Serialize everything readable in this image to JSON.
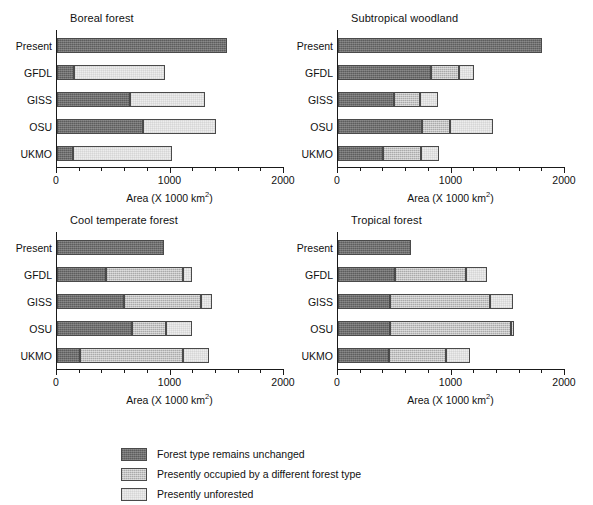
{
  "figure": {
    "categories": [
      "Present",
      "GFDL",
      "GISS",
      "OSU",
      "UKMO"
    ],
    "xlabel_pre": "Area (X 1000 km",
    "xlabel_sup": "2",
    "xlabel_post": ")",
    "xticklabels": [
      "0",
      "1000",
      "2000"
    ],
    "xlim": [
      0,
      2000
    ],
    "xtick_major": [
      0,
      1000,
      2000
    ],
    "xtick_minor_step": 200,
    "colors": {
      "unchanged": "#6f6f6f",
      "different_forest_type": "#c3c3c3",
      "unforested": "#ededed",
      "outline": "#4a4a4a",
      "axis": "#1a1a1a",
      "text": "#111111",
      "background": "#ffffff"
    }
  },
  "legend": {
    "items": [
      {
        "label": "Forest type remains unchanged",
        "swatch": "s0"
      },
      {
        "label": "Presently occupied by a different forest type",
        "swatch": "s1"
      },
      {
        "label": "Presently unforested",
        "swatch": "s2"
      }
    ]
  },
  "chart_data": [
    {
      "type": "bar",
      "orientation": "horizontal",
      "stacked": true,
      "title": "Boreal forest",
      "xlabel": "Area (X 1000 km2)",
      "ylabel": "",
      "xlim": [
        0,
        2000
      ],
      "grid": false,
      "legend_position": "below-figure",
      "categories": [
        "Present",
        "GFDL",
        "GISS",
        "OSU",
        "UKMO"
      ],
      "series": [
        {
          "name": "Forest type remains unchanged",
          "values": [
            1500,
            150,
            640,
            760,
            140
          ]
        },
        {
          "name": "Presently occupied by a different forest type",
          "values": [
            0,
            0,
            0,
            0,
            0
          ]
        },
        {
          "name": "Presently unforested",
          "values": [
            0,
            800,
            660,
            640,
            870
          ]
        }
      ],
      "totals": [
        1500,
        950,
        1300,
        1400,
        1010
      ]
    },
    {
      "type": "bar",
      "orientation": "horizontal",
      "stacked": true,
      "title": "Subtropical woodland",
      "xlabel": "Area (X 1000 km2)",
      "ylabel": "",
      "xlim": [
        0,
        2000
      ],
      "grid": false,
      "legend_position": "below-figure",
      "categories": [
        "Present",
        "GFDL",
        "GISS",
        "OSU",
        "UKMO"
      ],
      "series": [
        {
          "name": "Forest type remains unchanged",
          "values": [
            1800,
            820,
            490,
            740,
            400
          ]
        },
        {
          "name": "Presently occupied by a different forest type",
          "values": [
            0,
            250,
            230,
            250,
            330
          ]
        },
        {
          "name": "Presently unforested",
          "values": [
            0,
            130,
            160,
            380,
            160
          ]
        }
      ],
      "totals": [
        1800,
        1200,
        880,
        1370,
        890
      ]
    },
    {
      "type": "bar",
      "orientation": "horizontal",
      "stacked": true,
      "title": "Cool temperate forest",
      "xlabel": "Area (X 1000 km2)",
      "ylabel": "",
      "xlim": [
        0,
        2000
      ],
      "grid": false,
      "legend_position": "below-figure",
      "categories": [
        "Present",
        "GFDL",
        "GISS",
        "OSU",
        "UKMO"
      ],
      "series": [
        {
          "name": "Forest type remains unchanged",
          "values": [
            940,
            430,
            590,
            660,
            200
          ]
        },
        {
          "name": "Presently occupied by a different forest type",
          "values": [
            0,
            680,
            680,
            300,
            910
          ]
        },
        {
          "name": "Presently unforested",
          "values": [
            0,
            80,
            100,
            230,
            230
          ]
        }
      ],
      "totals": [
        940,
        1190,
        1370,
        1190,
        1340
      ]
    },
    {
      "type": "bar",
      "orientation": "horizontal",
      "stacked": true,
      "title": "Tropical forest",
      "xlabel": "Area (X 1000 km2)",
      "ylabel": "",
      "xlim": [
        0,
        2000
      ],
      "grid": false,
      "legend_position": "below-figure",
      "categories": [
        "Present",
        "GFDL",
        "GISS",
        "OSU",
        "UKMO"
      ],
      "series": [
        {
          "name": "Forest type remains unchanged",
          "values": [
            640,
            500,
            460,
            460,
            450
          ]
        },
        {
          "name": "Presently occupied by a different forest type",
          "values": [
            0,
            630,
            880,
            1060,
            500
          ]
        },
        {
          "name": "Presently unforested",
          "values": [
            0,
            180,
            200,
            30,
            210
          ]
        }
      ],
      "totals": [
        640,
        1310,
        1540,
        1550,
        1160
      ]
    }
  ],
  "panels": [
    {
      "title": "Boreal forest",
      "x": 56,
      "y": 30,
      "chart": 0
    },
    {
      "title": "Subtropical woodland",
      "x": 337,
      "y": 30,
      "chart": 1
    },
    {
      "title": "Cool temperate forest",
      "x": 56,
      "y": 232,
      "chart": 2
    },
    {
      "title": "Tropical forest",
      "x": 337,
      "y": 232,
      "chart": 3
    }
  ]
}
